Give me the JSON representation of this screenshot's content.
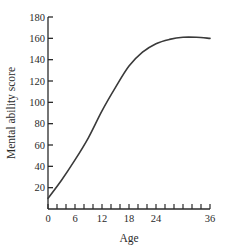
{
  "chart_data": {
    "type": "line",
    "title": "",
    "xlabel": "Age",
    "ylabel": "Mental ability score",
    "xlim": [
      0,
      36
    ],
    "ylim": [
      0,
      180
    ],
    "grid": false,
    "legend": null,
    "x_tick_labels": [
      "0",
      "6",
      "12",
      "18",
      "24",
      "36"
    ],
    "x_tick_values": [
      0,
      6,
      12,
      18,
      24,
      36
    ],
    "x_minor_tick_step": 2,
    "y_tick_labels": [
      "20",
      "40",
      "60",
      "80",
      "100",
      "120",
      "140",
      "160",
      "180"
    ],
    "y_tick_values": [
      20,
      40,
      60,
      80,
      100,
      120,
      140,
      160,
      180
    ],
    "series": [
      {
        "name": "Mental ability",
        "color": "#3a3a3a",
        "x": [
          0,
          3,
          6,
          9,
          12,
          15,
          18,
          21,
          24,
          27,
          30,
          33,
          36
        ],
        "values": [
          10,
          27,
          46,
          67,
          92,
          114,
          134,
          147,
          155,
          159,
          161,
          161,
          160
        ]
      }
    ]
  },
  "layout": {
    "plot_left": 48,
    "plot_right": 210,
    "plot_top": 17,
    "plot_bottom": 209,
    "axis_color": "#2a2a2a"
  }
}
